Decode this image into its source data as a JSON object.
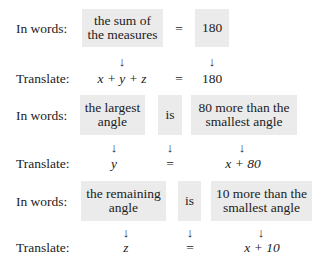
{
  "labels": {
    "in_words": "In words:",
    "translate": "Translate:"
  },
  "rows": [
    {
      "words": [
        "the sum of\nthe measures",
        "=",
        "180"
      ],
      "translate": [
        "x + y + z",
        "=",
        "180"
      ]
    },
    {
      "words": [
        "the largest\nangle",
        "is",
        "80 more than the\nsmallest angle"
      ],
      "translate": [
        "y",
        "=",
        "x + 80"
      ]
    },
    {
      "words": [
        "the remaining\nangle",
        "is",
        "10 more than the\nsmallest angle"
      ],
      "translate": [
        "z",
        "=",
        "x + 10"
      ]
    }
  ],
  "arrow_glyph": "↓",
  "box_color": "#ebebeb"
}
